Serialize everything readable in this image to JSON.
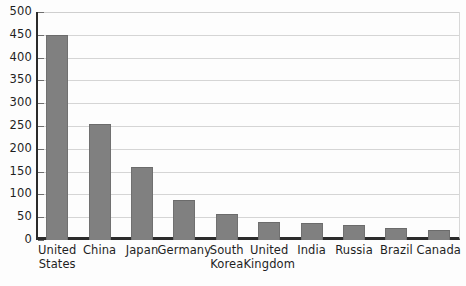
{
  "chart_data": {
    "type": "bar",
    "title": "",
    "xlabel": "",
    "ylabel": "",
    "ylim": [
      0,
      500
    ],
    "ytick_step": 50,
    "yticks": [
      500,
      450,
      400,
      350,
      300,
      250,
      200,
      150,
      100,
      50,
      0
    ],
    "ytick_labels": [
      "500",
      "450",
      "400",
      "350",
      "300",
      "250",
      "200",
      "150",
      "100",
      "50",
      "0"
    ],
    "grid": true,
    "legend": null,
    "bar_color": "#808080",
    "axis_color": "#2b2b2b",
    "gridline_color": "#d5d5d5",
    "categories": [
      "United\nStates",
      "China",
      "Japan",
      "Germany",
      "South\nKorea",
      "United\nKingdom",
      "India",
      "Russia",
      "Brazil",
      "Canada"
    ],
    "values": [
      450,
      255,
      160,
      88,
      57,
      40,
      38,
      34,
      26,
      22
    ]
  }
}
